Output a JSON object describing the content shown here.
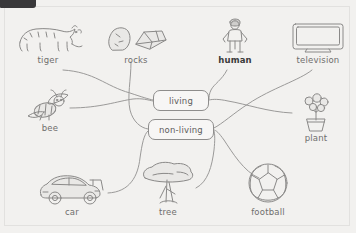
{
  "window": {
    "top_bar_color": "#39383a"
  },
  "worksheet": {
    "background_color": "#f2f1ef",
    "ink_color": "#8a8988",
    "caption_color": "#6f6e6d",
    "highlight_color": "#3a3a3a"
  },
  "categories": [
    {
      "id": "living",
      "label": "living"
    },
    {
      "id": "non-living",
      "label": "non-living"
    }
  ],
  "items": [
    {
      "id": "tiger",
      "label": "tiger",
      "icon": "tiger-icon",
      "category": "living",
      "emphasis": false
    },
    {
      "id": "rocks",
      "label": "rocks",
      "icon": "rocks-icon",
      "category": "non-living",
      "emphasis": false
    },
    {
      "id": "human",
      "label": "human",
      "icon": "human-icon",
      "category": "living",
      "emphasis": true
    },
    {
      "id": "television",
      "label": "television",
      "icon": "television-icon",
      "category": "non-living",
      "emphasis": false
    },
    {
      "id": "bee",
      "label": "bee",
      "icon": "bee-icon",
      "category": "living",
      "emphasis": false
    },
    {
      "id": "plant",
      "label": "plant",
      "icon": "plant-icon",
      "category": "living",
      "emphasis": false
    },
    {
      "id": "car",
      "label": "car",
      "icon": "car-icon",
      "category": "non-living",
      "emphasis": false
    },
    {
      "id": "tree",
      "label": "tree",
      "icon": "tree-icon",
      "category": "living",
      "emphasis": false
    },
    {
      "id": "football",
      "label": "football",
      "icon": "football-icon",
      "category": "non-living",
      "emphasis": false
    }
  ]
}
